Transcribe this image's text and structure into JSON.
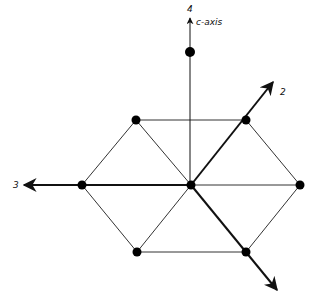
{
  "diagram": {
    "type": "hexagonal lattice with crystallographic axes",
    "axes": [
      {
        "id": "axis-4",
        "label": "4",
        "note": "c-axis",
        "from": [
          190,
          185
        ],
        "to": [
          190,
          18
        ],
        "label_pos": [
          187,
          12
        ]
      },
      {
        "id": "axis-2",
        "label": "2",
        "from": [
          191,
          185
        ],
        "to": [
          273,
          82
        ],
        "label_pos": [
          280,
          95
        ]
      },
      {
        "id": "axis-3",
        "label": "3",
        "from": [
          191,
          185
        ],
        "to": [
          24,
          185
        ],
        "label_pos": [
          13,
          188
        ]
      },
      {
        "id": "axis-1",
        "label": "",
        "from": [
          191,
          185
        ],
        "to": [
          277,
          290
        ],
        "label_pos": null
      }
    ],
    "c_axis_label": "c-axis",
    "nodes": [
      {
        "id": "top",
        "x": 190,
        "y": 52
      },
      {
        "id": "upper-left",
        "x": 136,
        "y": 120
      },
      {
        "id": "upper-right",
        "x": 246,
        "y": 120
      },
      {
        "id": "left",
        "x": 82,
        "y": 185
      },
      {
        "id": "center",
        "x": 191,
        "y": 185
      },
      {
        "id": "right",
        "x": 300,
        "y": 185
      },
      {
        "id": "lower-left",
        "x": 137,
        "y": 252
      },
      {
        "id": "lower-right",
        "x": 246,
        "y": 252
      }
    ],
    "edges": [
      [
        "upper-left",
        "upper-right"
      ],
      [
        "upper-right",
        "right"
      ],
      [
        "right",
        "lower-right"
      ],
      [
        "lower-right",
        "lower-left"
      ],
      [
        "lower-left",
        "left"
      ],
      [
        "left",
        "upper-left"
      ],
      [
        "upper-left",
        "center"
      ],
      [
        "center",
        "right"
      ],
      [
        "center",
        "lower-left"
      ]
    ],
    "colors": {
      "line": "#333333",
      "axis": "#111111",
      "node": "#000000"
    }
  }
}
